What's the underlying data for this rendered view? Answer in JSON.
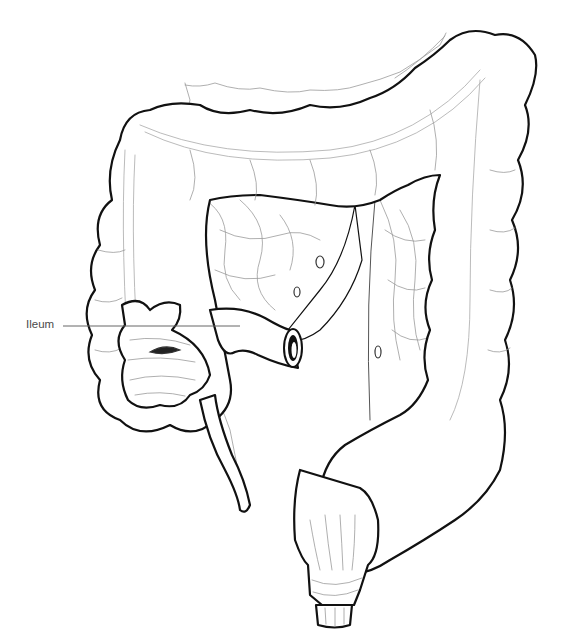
{
  "diagram": {
    "labels": [
      {
        "id": "ileum",
        "text": "Ileum",
        "x": 26,
        "y": 319
      }
    ],
    "colors": {
      "outline": "#111111",
      "detail": "#9a9a9a",
      "background": "#ffffff",
      "label": "#4a4a4a"
    }
  }
}
